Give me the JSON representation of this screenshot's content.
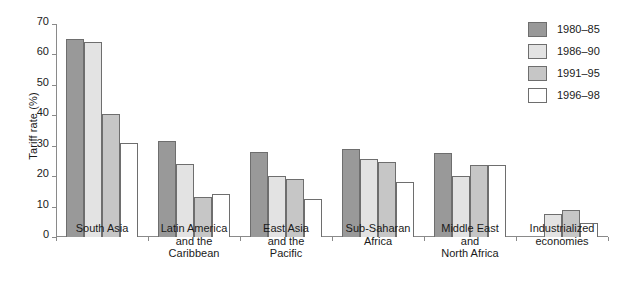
{
  "chart_data": {
    "type": "bar",
    "title": "",
    "xlabel": "",
    "ylabel": "Tariff rate (%)",
    "ylim": [
      0,
      70
    ],
    "yticks": [
      0,
      10,
      20,
      30,
      40,
      50,
      60,
      70
    ],
    "grid": false,
    "legend_position": "top-right",
    "categories": [
      "South Asia",
      "Latin America\nand the\nCaribbean",
      "East Asia\nand the\nPacific",
      "Sub-Saharan\nAfrica",
      "Middle East\nand\nNorth Africa",
      "Industrialized\neconomies"
    ],
    "series": [
      {
        "name": "1980–85",
        "color": "#999999",
        "values": [
          65,
          31.5,
          28,
          29,
          27.5,
          null
        ]
      },
      {
        "name": "1986–90",
        "color": "#e3e3e3",
        "values": [
          64,
          24,
          20,
          25.5,
          20,
          7.5
        ]
      },
      {
        "name": "1991–95",
        "color": "#c6c6c6",
        "values": [
          40.5,
          13,
          19,
          24.5,
          23.8,
          9
        ]
      },
      {
        "name": "1996–98",
        "color": "#ffffff",
        "values": [
          31,
          14,
          12.5,
          18,
          23.8,
          4.5
        ]
      }
    ]
  },
  "axis": {
    "y_title": "Tariff rate (%)"
  }
}
